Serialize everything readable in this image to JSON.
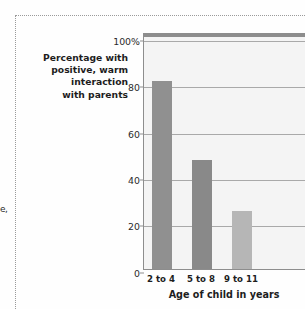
{
  "page": {
    "edge_fragment": "e,"
  },
  "chart_data": {
    "type": "bar",
    "title": "",
    "categories": [
      "2 to 4",
      "5 to 8",
      "9 to 11"
    ],
    "values": [
      81,
      47,
      25
    ],
    "bar_colors": [
      "#909090",
      "#898989",
      "#b6b6b6"
    ],
    "xlabel": "Age of child in years",
    "ylabel": "Percentage with positive, warm interaction with parents",
    "ylabel_lines": [
      "Percentage with",
      "positive, warm",
      "interaction",
      "with parents"
    ],
    "ylim": [
      0,
      100
    ],
    "yticks": [
      0,
      20,
      40,
      60,
      80,
      100
    ],
    "ytick_labels": [
      "0",
      "20",
      "40",
      "60",
      "80",
      "100%"
    ],
    "grid": true,
    "legend": "none",
    "plot_background": "#f4f4f4",
    "axis_color": "#8d8d8d",
    "gridline_color": "#a9a9a9"
  }
}
